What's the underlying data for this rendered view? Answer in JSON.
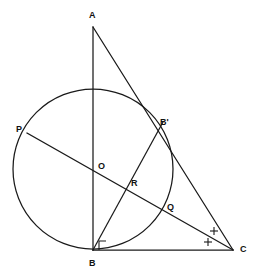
{
  "figure": {
    "canvas": {
      "width": 254,
      "height": 278,
      "background": "#ffffff"
    },
    "stroke_color": "#1a1a1a",
    "label_color": "#111111",
    "points": {
      "A": {
        "label": "A",
        "x": 93,
        "y": 27,
        "label_x": 89,
        "label_y": 11
      },
      "B": {
        "label": "B",
        "x": 93,
        "y": 250,
        "label_x": 89,
        "label_y": 260
      },
      "C": {
        "label": "C",
        "x": 233,
        "y": 250,
        "label_x": 240,
        "label_y": 246
      },
      "Bp": {
        "label": "B'",
        "x": 157,
        "y": 133,
        "label_x": 160,
        "label_y": 119
      },
      "O": {
        "label": "O",
        "x": 93,
        "y": 169,
        "label_x": 98,
        "label_y": 163
      },
      "P": {
        "label": "P",
        "x": 27,
        "y": 133,
        "label_x": 16,
        "label_y": 126
      },
      "Q": {
        "label": "Q",
        "x": 163,
        "y": 208,
        "label_x": 167,
        "label_y": 204
      },
      "R": {
        "label": "R",
        "x": 127,
        "y": 186,
        "label_x": 131,
        "label_y": 180
      }
    },
    "circle": {
      "cx": 93,
      "cy": 169,
      "r": 80
    },
    "segments": [
      {
        "name": "segment-AB",
        "x1": 93,
        "y1": 27,
        "x2": 93,
        "y2": 250
      },
      {
        "name": "segment-AC",
        "x1": 93,
        "y1": 27,
        "x2": 233,
        "y2": 250
      },
      {
        "name": "segment-BC",
        "x1": 93,
        "y1": 250,
        "x2": 233,
        "y2": 250
      },
      {
        "name": "segment-BBprime",
        "x1": 93,
        "y1": 250,
        "x2": 163,
        "y2": 122
      },
      {
        "name": "segment-PC",
        "x1": 27,
        "y1": 133,
        "x2": 233,
        "y2": 250
      }
    ],
    "angle_marks": {
      "plus_marks": [
        {
          "name": "angle-plus-lower",
          "cx": 208,
          "cy": 242,
          "size": 4
        },
        {
          "name": "angle-plus-upper",
          "cx": 214,
          "cy": 231,
          "size": 4
        }
      ],
      "right_angle": {
        "name": "right-angle-at-B",
        "points": "99,250 99,241 106,241"
      }
    }
  }
}
